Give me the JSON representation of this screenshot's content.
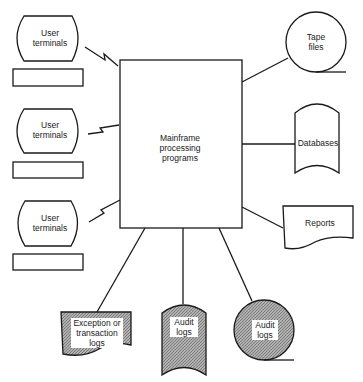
{
  "diagram": {
    "title": "",
    "center": {
      "label": "Mainframe\nprocessing\nprograms"
    },
    "terminals": [
      {
        "label": "User\nterminals"
      },
      {
        "label": "User\nterminals"
      },
      {
        "label": "User\nterminals"
      }
    ],
    "outputs": {
      "tape_files": {
        "label": "Tape\nfiles"
      },
      "databases": {
        "label": "Databases"
      },
      "reports": {
        "label": "Reports"
      },
      "exception_logs": {
        "label": "Exception or\ntransaction\nlogs"
      },
      "audit_logs_disk": {
        "label": "Audit\nlogs"
      },
      "audit_logs_tape": {
        "label": "Audit\nlogs"
      }
    },
    "colors": {
      "stroke": "#1a1a1a",
      "shade": "#9a9a9a",
      "background": "#ffffff"
    }
  }
}
